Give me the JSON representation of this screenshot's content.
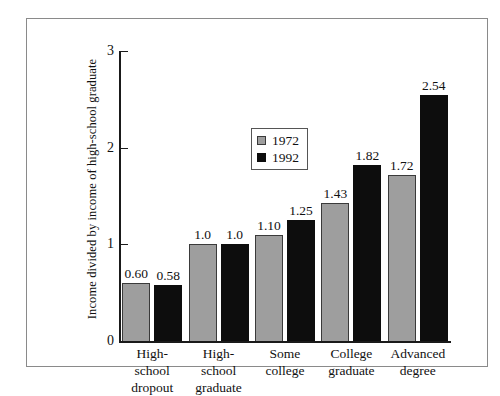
{
  "chart_data": {
    "type": "bar",
    "title": "",
    "xlabel": "",
    "ylabel": "Income divided by income of high-school graduate",
    "ylim": [
      0,
      3
    ],
    "yticks": [
      "0",
      "1",
      "2",
      "3"
    ],
    "grid": false,
    "legend_position": "upper-left-inside",
    "categories": [
      "High-school dropout",
      "High-school graduate",
      "Some college",
      "College graduate",
      "Advanced degree"
    ],
    "category_lines": [
      [
        "High-school",
        "dropout"
      ],
      [
        "High-school",
        "graduate"
      ],
      [
        "Some",
        "college"
      ],
      [
        "College",
        "graduate"
      ],
      [
        "Advanced",
        "degree"
      ]
    ],
    "series": [
      {
        "name": "1972",
        "color": "#9e9e9e",
        "values": [
          0.6,
          1.0,
          1.1,
          1.43,
          1.72
        ],
        "labels": [
          "0.60",
          "1.0",
          "1.10",
          "1.43",
          "1.72"
        ]
      },
      {
        "name": "1992",
        "color": "#0d0d0d",
        "values": [
          0.58,
          1.0,
          1.25,
          1.82,
          2.54
        ],
        "labels": [
          "0.58",
          "1.0",
          "1.25",
          "1.82",
          "2.54"
        ]
      }
    ]
  },
  "legend": {
    "entries": [
      {
        "label": "1972",
        "swatch": "gray-swatch-icon"
      },
      {
        "label": "1992",
        "swatch": "black-swatch-icon"
      }
    ]
  }
}
